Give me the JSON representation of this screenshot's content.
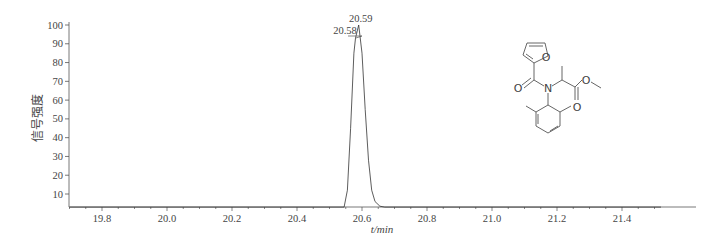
{
  "chart_data": {
    "type": "line",
    "title": "",
    "xlabel": "t/min",
    "ylabel": "信号强度",
    "xlim": [
      19.7,
      21.52
    ],
    "ylim": [
      3,
      100
    ],
    "x_ticks": [
      "19.8",
      "20.0",
      "20.2",
      "20.4",
      "20.6",
      "20.8",
      "21.0",
      "21.2",
      "21.4"
    ],
    "y_ticks": [
      "10",
      "20",
      "30",
      "40",
      "50",
      "60",
      "70",
      "80",
      "90",
      "100"
    ],
    "grid": false,
    "series": [
      {
        "name": "chromatogram",
        "x": [
          19.7,
          20.4,
          20.545,
          20.555,
          20.565,
          20.575,
          20.58,
          20.59,
          20.6,
          20.61,
          20.62,
          20.63,
          20.64,
          20.655,
          20.67,
          21.52
        ],
        "y": [
          3,
          3,
          3,
          12,
          45,
          85,
          93,
          100,
          85,
          55,
          28,
          12,
          6,
          3.5,
          3,
          3
        ]
      }
    ],
    "annotations": [
      {
        "text": "20.59",
        "x": 20.59,
        "y": 100
      },
      {
        "text": "20.58",
        "x": 20.58,
        "y": 93
      }
    ]
  },
  "structure": {
    "label_o_furan": "O",
    "label_o_carbonyl": "O",
    "label_n": "N",
    "label_o_ester1": "O",
    "label_o_ester2": "O"
  }
}
